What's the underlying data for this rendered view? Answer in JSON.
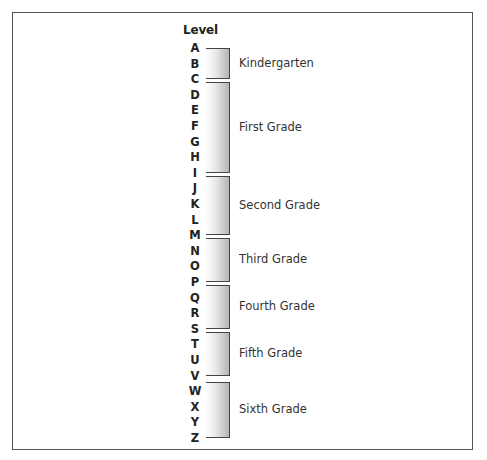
{
  "diagram": {
    "title": "Level",
    "letters": [
      "A",
      "B",
      "C",
      "D",
      "E",
      "F",
      "G",
      "H",
      "I",
      "J",
      "K",
      "L",
      "M",
      "N",
      "O",
      "P",
      "Q",
      "R",
      "S",
      "T",
      "U",
      "V",
      "W",
      "X",
      "Y",
      "Z"
    ],
    "groups": [
      {
        "label": "Kindergarten",
        "from": "A",
        "to": "C"
      },
      {
        "label": "First Grade",
        "from": "C",
        "to": "I"
      },
      {
        "label": "Second Grade",
        "from": "I",
        "to": "M"
      },
      {
        "label": "Third Grade",
        "from": "M",
        "to": "P"
      },
      {
        "label": "Fourth Grade",
        "from": "P",
        "to": "S"
      },
      {
        "label": "Fifth Grade",
        "from": "S",
        "to": "V"
      },
      {
        "label": "Sixth Grade",
        "from": "W",
        "to": "Z"
      }
    ]
  }
}
